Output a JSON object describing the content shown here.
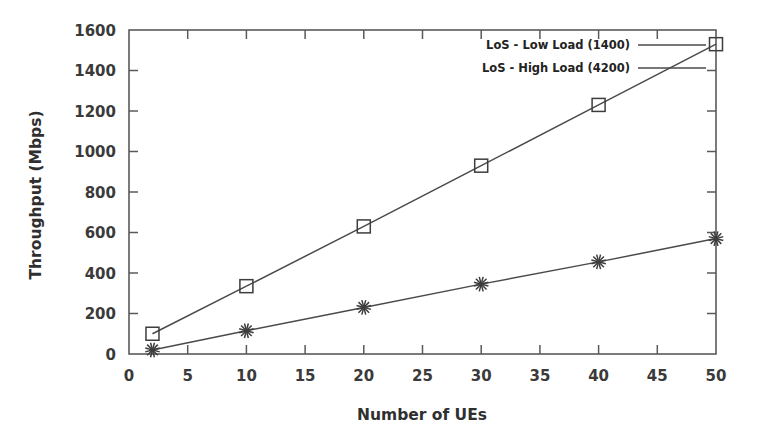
{
  "chart_data": {
    "type": "line",
    "title": "",
    "subtitle": "",
    "xlabel": "Number of UEs",
    "ylabel": "Throughput (Mbps)",
    "xlim": [
      0,
      50
    ],
    "ylim": [
      0,
      1600
    ],
    "xticks": [
      0,
      5,
      10,
      15,
      20,
      25,
      30,
      35,
      40,
      45,
      50
    ],
    "yticks": [
      0,
      200,
      400,
      600,
      800,
      1000,
      1200,
      1400,
      1600
    ],
    "xtick_labels": [
      "0",
      "5",
      "10",
      "15",
      "20",
      "25",
      "30",
      "35",
      "40",
      "45",
      "50"
    ],
    "ytick_labels": [
      "0",
      "200",
      "400",
      "600",
      "800",
      "1000",
      "1200",
      "1400",
      "1600"
    ],
    "grid": false,
    "legend_position": "top-right-inside",
    "x": [
      2,
      10,
      20,
      30,
      40,
      50
    ],
    "series": [
      {
        "name": "LoS - Low Load (1400)",
        "marker": "square-open",
        "values": [
          100,
          335,
          630,
          930,
          1230,
          1530
        ]
      },
      {
        "name": "LoS - High Load (4200)",
        "marker": "asterisk",
        "values": [
          20,
          115,
          230,
          345,
          455,
          570
        ]
      }
    ],
    "colors": {
      "series_1": "#4a4a4a",
      "series_2": "#4a4a4a",
      "axis": "#5a5a5a",
      "text": "#2f2f2f",
      "background": "#ffffff"
    }
  },
  "legend": {
    "entries": [
      {
        "label": "LoS - Low Load (1400)"
      },
      {
        "label": "LoS - High Load (4200)"
      }
    ]
  },
  "axes": {
    "x_title": "Number of UEs",
    "y_title": "Throughput (Mbps)"
  }
}
